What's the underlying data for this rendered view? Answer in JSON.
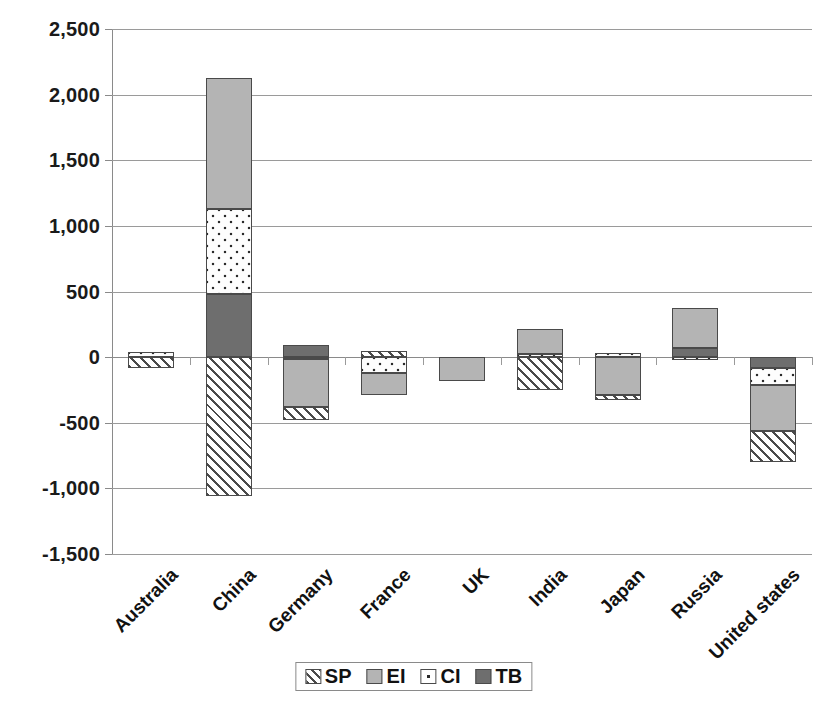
{
  "chart_data": {
    "type": "bar",
    "stacked": true,
    "title": "",
    "xlabel": "",
    "ylabel": "",
    "ylim": [
      -1500,
      2500
    ],
    "ytick_step": 500,
    "ytick_labels": [
      "2,500",
      "2,000",
      "1,500",
      "1,000",
      "500",
      "0",
      "-500",
      "-1,000",
      "-1,500"
    ],
    "ytick_values": [
      2500,
      2000,
      1500,
      1000,
      500,
      0,
      -500,
      -1000,
      -1500
    ],
    "grid": true,
    "legend_position": "bottom",
    "categories": [
      "Australia",
      "China",
      "Germany",
      "France",
      "UK",
      "India",
      "Japan",
      "Russia",
      "United states"
    ],
    "series": [
      {
        "name": "SP",
        "key": "sp",
        "pattern": "diagonal-hatch",
        "color": "#ffffff",
        "values": [
          -85,
          -1060,
          -100,
          45,
          0,
          -250,
          -40,
          0,
          -235
        ]
      },
      {
        "name": "EI",
        "key": "ei",
        "pattern": "solid-light-grey",
        "color": "#b4b4b4",
        "values": [
          0,
          1005,
          -365,
          -170,
          -180,
          215,
          -285,
          305,
          -350
        ]
      },
      {
        "name": "CI",
        "key": "ci",
        "pattern": "white-dots",
        "color": "#fdfdfd",
        "values": [
          40,
          645,
          -15,
          -120,
          0,
          25,
          30,
          -25,
          -130
        ]
      },
      {
        "name": "TB",
        "key": "tb",
        "pattern": "solid-dark-grey",
        "color": "#6e6e6e",
        "values": [
          0,
          480,
          95,
          0,
          0,
          0,
          0,
          70,
          -85
        ]
      }
    ],
    "stack_layout": [
      {
        "category": "Australia",
        "positive": [
          {
            "series": "CI",
            "from": 0,
            "to": 40
          }
        ],
        "negative": [
          {
            "series": "SP",
            "from": 0,
            "to": -85
          }
        ]
      },
      {
        "category": "China",
        "positive": [
          {
            "series": "TB",
            "from": 0,
            "to": 480
          },
          {
            "series": "CI",
            "from": 480,
            "to": 1125
          },
          {
            "series": "EI",
            "from": 1125,
            "to": 2130
          }
        ],
        "negative": [
          {
            "series": "SP",
            "from": 0,
            "to": -1060
          }
        ]
      },
      {
        "category": "Germany",
        "positive": [
          {
            "series": "TB",
            "from": 0,
            "to": 95
          }
        ],
        "negative": [
          {
            "series": "CI",
            "from": 0,
            "to": -15
          },
          {
            "series": "EI",
            "from": -15,
            "to": -380
          },
          {
            "series": "SP",
            "from": -380,
            "to": -480
          }
        ]
      },
      {
        "category": "France",
        "positive": [
          {
            "series": "SP",
            "from": 0,
            "to": 45
          }
        ],
        "negative": [
          {
            "series": "CI",
            "from": 0,
            "to": -120
          },
          {
            "series": "EI",
            "from": -120,
            "to": -290
          }
        ]
      },
      {
        "category": "UK",
        "positive": [],
        "negative": [
          {
            "series": "EI",
            "from": 0,
            "to": -180
          }
        ]
      },
      {
        "category": "India",
        "positive": [
          {
            "series": "CI",
            "from": 0,
            "to": 25
          },
          {
            "series": "EI",
            "from": 25,
            "to": 215
          }
        ],
        "negative": [
          {
            "series": "SP",
            "from": 0,
            "to": -250
          }
        ]
      },
      {
        "category": "Japan",
        "positive": [
          {
            "series": "CI",
            "from": 0,
            "to": 30
          }
        ],
        "negative": [
          {
            "series": "EI",
            "from": 0,
            "to": -285
          },
          {
            "series": "SP",
            "from": -285,
            "to": -325
          }
        ]
      },
      {
        "category": "Russia",
        "positive": [
          {
            "series": "TB",
            "from": 0,
            "to": 70
          },
          {
            "series": "EI",
            "from": 70,
            "to": 375
          }
        ],
        "negative": [
          {
            "series": "CI",
            "from": 0,
            "to": -25
          }
        ]
      },
      {
        "category": "United states",
        "positive": [],
        "negative": [
          {
            "series": "TB",
            "from": 0,
            "to": -85
          },
          {
            "series": "CI",
            "from": -85,
            "to": -215
          },
          {
            "series": "EI",
            "from": -215,
            "to": -565
          },
          {
            "series": "SP",
            "from": -565,
            "to": -800
          }
        ]
      }
    ]
  },
  "legend": {
    "items": [
      {
        "label": "SP",
        "key": "sp"
      },
      {
        "label": "EI",
        "key": "ei"
      },
      {
        "label": "CI",
        "key": "ci"
      },
      {
        "label": "TB",
        "key": "tb"
      }
    ]
  }
}
